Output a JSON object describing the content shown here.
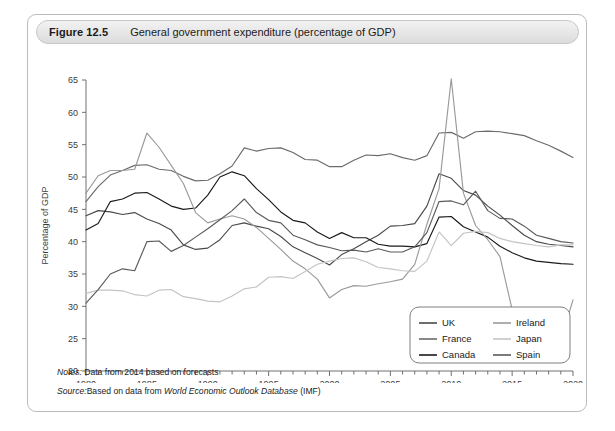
{
  "figure": {
    "number": "Figure 12.5",
    "title": "General government expenditure (percentage of GDP)",
    "notes_label": "Notes:",
    "notes_text": "Data from 2014 based on forecasts",
    "source_label": "Source:",
    "source_prefix": "Based on data from ",
    "source_italic": "World Economic Outlook Database",
    "source_suffix": " (IMF)"
  },
  "legend": {
    "entries": [
      {
        "label": "UK",
        "color": "#4a4a4a",
        "column": "left"
      },
      {
        "label": "France",
        "color": "#6b6b6b",
        "column": "left"
      },
      {
        "label": "Canada",
        "color": "#1a1a1a",
        "column": "left"
      },
      {
        "label": "Ireland",
        "color": "#9a9a9a",
        "column": "right"
      },
      {
        "label": "Japan",
        "color": "#c4c4c4",
        "column": "right"
      },
      {
        "label": "Spain",
        "color": "#5a5a5a",
        "column": "right"
      }
    ]
  },
  "chart_data": {
    "type": "line",
    "title": "General government expenditure (percentage of GDP)",
    "xlabel": "",
    "ylabel": "Percentage of GDP",
    "xlim": [
      1980,
      2020
    ],
    "ylim": [
      20,
      65
    ],
    "yticks": [
      20,
      25,
      30,
      35,
      40,
      45,
      50,
      55,
      60,
      65
    ],
    "xticks": [
      1980,
      1985,
      1990,
      1995,
      2000,
      2005,
      2010,
      2015,
      2020
    ],
    "xminor_step": 1,
    "grid": false,
    "legend_position": "bottom-right",
    "x": [
      1980,
      1981,
      1982,
      1983,
      1984,
      1985,
      1986,
      1987,
      1988,
      1989,
      1990,
      1991,
      1992,
      1993,
      1994,
      1995,
      1996,
      1997,
      1998,
      1999,
      2000,
      2001,
      2002,
      2003,
      2004,
      2005,
      2006,
      2007,
      2008,
      2009,
      2010,
      2011,
      2012,
      2013,
      2014,
      2015,
      2016,
      2017,
      2018,
      2019,
      2020
    ],
    "series": [
      {
        "name": "UK",
        "color": "#4a4a4a",
        "values": [
          44.0,
          44.8,
          44.6,
          44.2,
          44.5,
          43.5,
          42.8,
          41.8,
          39.5,
          38.8,
          39.0,
          40.3,
          42.5,
          42.9,
          42.4,
          42.0,
          40.8,
          39.2,
          38.3,
          37.4,
          36.4,
          38.0,
          38.9,
          40.0,
          41.0,
          42.4,
          42.5,
          42.8,
          45.5,
          50.5,
          49.8,
          47.9,
          47.2,
          45.5,
          44.1,
          42.5,
          41.0,
          40.0,
          39.6,
          39.4,
          39.2
        ]
      },
      {
        "name": "France",
        "color": "#6b6b6b",
        "values": [
          46.2,
          48.5,
          50.3,
          51.0,
          51.8,
          51.9,
          51.2,
          51.0,
          50.1,
          49.4,
          49.5,
          50.5,
          51.7,
          54.5,
          54.0,
          54.4,
          54.5,
          53.8,
          52.7,
          52.6,
          51.6,
          51.6,
          52.6,
          53.4,
          53.3,
          53.6,
          53.0,
          52.6,
          53.3,
          56.8,
          56.9,
          56.0,
          57.0,
          57.1,
          57.0,
          56.7,
          56.4,
          55.6,
          54.9,
          54.0,
          53.0
        ]
      },
      {
        "name": "Canada",
        "color": "#1a1a1a",
        "values": [
          41.8,
          42.8,
          46.2,
          46.6,
          47.5,
          47.6,
          46.6,
          45.5,
          45.0,
          45.2,
          47.2,
          50.0,
          50.8,
          50.2,
          48.2,
          46.5,
          44.6,
          43.3,
          42.9,
          41.5,
          40.5,
          41.4,
          40.6,
          40.6,
          39.6,
          39.3,
          39.3,
          39.2,
          39.7,
          43.8,
          43.9,
          42.3,
          41.5,
          40.7,
          39.3,
          38.3,
          37.5,
          37.0,
          36.8,
          36.6,
          36.5
        ]
      },
      {
        "name": "Ireland",
        "color": "#9a9a9a",
        "values": [
          47.5,
          50.2,
          51.0,
          51.0,
          51.2,
          56.8,
          54.6,
          51.8,
          49.0,
          44.5,
          42.9,
          43.5,
          44.0,
          43.5,
          42.2,
          40.5,
          38.8,
          37.0,
          35.8,
          34.2,
          31.3,
          32.6,
          33.2,
          33.1,
          33.5,
          33.8,
          34.2,
          36.5,
          42.7,
          48.2,
          65.2,
          47.5,
          42.5,
          40.3,
          37.7,
          29.5,
          28.0,
          26.3,
          25.5,
          24.8,
          31.0
        ]
      },
      {
        "name": "Japan",
        "color": "#c4c4c4",
        "values": [
          32.0,
          32.5,
          32.5,
          32.4,
          31.8,
          31.6,
          32.5,
          32.6,
          31.5,
          31.2,
          30.8,
          30.7,
          31.6,
          32.7,
          33.0,
          34.5,
          34.6,
          34.3,
          35.4,
          36.5,
          37.0,
          37.4,
          37.5,
          36.9,
          36.0,
          35.8,
          35.5,
          35.4,
          37.0,
          41.5,
          39.4,
          41.3,
          41.6,
          41.4,
          40.5,
          40.0,
          39.7,
          39.4,
          39.2,
          39.5,
          39.5
        ]
      },
      {
        "name": "Spain",
        "color": "#5a5a5a",
        "values": [
          30.5,
          32.6,
          35.0,
          35.8,
          35.5,
          40.0,
          40.1,
          38.5,
          39.4,
          40.7,
          42.0,
          43.4,
          44.8,
          46.6,
          44.5,
          43.3,
          42.9,
          41.0,
          40.3,
          39.5,
          39.1,
          38.6,
          38.7,
          38.4,
          38.9,
          38.4,
          38.4,
          39.2,
          41.4,
          46.2,
          46.3,
          45.7,
          47.8,
          44.8,
          43.6,
          43.5,
          42.4,
          41.0,
          40.5,
          40.0,
          39.8
        ]
      }
    ]
  }
}
